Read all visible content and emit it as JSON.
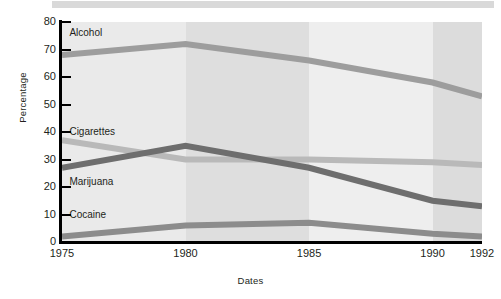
{
  "chart_data": {
    "type": "line",
    "title": "",
    "xlabel": "Dates",
    "ylabel": "Percentage",
    "categories": [
      "1975",
      "1980",
      "1985",
      "1990",
      "1992"
    ],
    "x": [
      1975,
      1980,
      1985,
      1990,
      1992
    ],
    "xlim": [
      1975,
      1992
    ],
    "ylim": [
      0,
      80
    ],
    "yticks": [
      0,
      10,
      20,
      30,
      40,
      50,
      60,
      70,
      80
    ],
    "ytick_labels": [
      "0",
      "10",
      "20",
      "30",
      "40",
      "50",
      "60",
      "70",
      "80"
    ],
    "grid": false,
    "legend_position": "inline-labels",
    "series": [
      {
        "name": "Alcohol",
        "color": "#9d9d9d",
        "values": [
          68,
          72,
          66,
          58,
          53
        ]
      },
      {
        "name": "Cigarettes",
        "color": "#b9b9b9",
        "values": [
          37,
          30,
          30,
          29,
          28
        ]
      },
      {
        "name": "Marijuana",
        "color": "#6e6e6e",
        "values": [
          27,
          35,
          27,
          15,
          13
        ]
      },
      {
        "name": "Cocaine",
        "color": "#8c8c8c",
        "values": [
          2,
          6,
          7,
          3,
          2
        ]
      }
    ],
    "background_bands": [
      {
        "from": 1975,
        "to": 1980,
        "color": "#eaeaea"
      },
      {
        "from": 1980,
        "to": 1985,
        "color": "#dedede"
      },
      {
        "from": 1985,
        "to": 1990,
        "color": "#eeeeee"
      },
      {
        "from": 1990,
        "to": 1992,
        "color": "#dcdcdc"
      }
    ],
    "annotations": [
      {
        "text": "Alcohol",
        "x": 1975.3,
        "y": 76
      },
      {
        "text": "Cigarettes",
        "x": 1975.3,
        "y": 40
      },
      {
        "text": "Marijuana",
        "x": 1975.3,
        "y": 22
      },
      {
        "text": "Cocaine",
        "x": 1975.3,
        "y": 10
      }
    ]
  },
  "figure": {
    "top_rule_color": "#d9d9d9",
    "axis_color": "#000000",
    "plot_background": "#ebebeb"
  }
}
